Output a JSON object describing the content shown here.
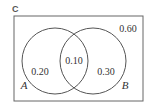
{
  "diagram": {
    "type": "venn",
    "universe_label": "C",
    "sets": [
      {
        "name": "A",
        "only_value": "0.20"
      },
      {
        "name": "B",
        "only_value": "0.30"
      }
    ],
    "intersection_value": "0.10",
    "outside_value": "0.60",
    "colors": {
      "line": "#555555",
      "text": "#333333",
      "background": "#ffffff"
    }
  }
}
